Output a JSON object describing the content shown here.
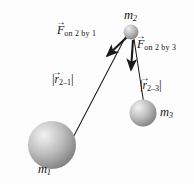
{
  "figure": {
    "background_color": "#fdfdfd",
    "line_color": "#1a1a1a",
    "sphere_color_light": "#e8e8e8",
    "sphere_color_mid": "#b5b5b5",
    "sphere_color_dark": "#6e6e6e"
  },
  "masses": [
    {
      "id": "m1",
      "label": "m",
      "subscript": "1",
      "cx": 52,
      "cy": 145,
      "r": 24,
      "label_x": 38,
      "label_y": 165
    },
    {
      "id": "m2",
      "label": "m",
      "subscript": "2",
      "cx": 131,
      "cy": 32,
      "r": 7.5,
      "label_x": 124,
      "label_y": 9
    },
    {
      "id": "m3",
      "label": "m",
      "subscript": "3",
      "cx": 143,
      "cy": 113,
      "r": 13.5,
      "label_x": 160,
      "label_y": 107
    }
  ],
  "forces": [
    {
      "id": "F_on_2_by_1",
      "symbol": "F",
      "vector_arrow": "→",
      "subscript": "on 2 by 1",
      "from_x": 127,
      "from_y": 37,
      "to_x": 108,
      "to_y": 57,
      "label_x": 57,
      "label_y": 26
    },
    {
      "id": "F_on_2_by_3",
      "symbol": "F",
      "vector_arrow": "→",
      "subscript": "on 2 by 3",
      "from_x": 133,
      "from_y": 39,
      "to_x": 131,
      "to_y": 73,
      "label_x": 137,
      "label_y": 39
    }
  ],
  "distances": [
    {
      "id": "r_2_1",
      "symbol": "r",
      "vector_arrow": "→",
      "subscript": "2–1",
      "from_x": 126,
      "from_y": 36,
      "to_x": 66,
      "to_y": 151,
      "label_x": 52,
      "label_y": 71
    },
    {
      "id": "r_2_3",
      "symbol": "r",
      "vector_arrow": "→",
      "subscript": "2–3",
      "from_x": 134,
      "from_y": 39,
      "to_x": 146,
      "to_y": 118,
      "label_x": 140,
      "label_y": 77
    }
  ],
  "bar_char": "|"
}
